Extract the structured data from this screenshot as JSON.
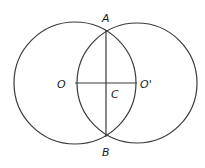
{
  "diagram": {
    "type": "geometry",
    "stroke_color": "#3a3a3a",
    "label_color": "#1a1a1a",
    "circles": [
      {
        "id": "circle-O",
        "cx": 75,
        "cy": 83,
        "r": 61
      },
      {
        "id": "circle-O-prime",
        "cx": 137,
        "cy": 83,
        "r": 60
      }
    ],
    "segments": [
      {
        "id": "segment-AB",
        "from": "A",
        "to": "B",
        "x1": 106,
        "y1": 30,
        "x2": 106,
        "y2": 137
      },
      {
        "id": "segment-OO-prime",
        "from": "O",
        "to": "O'",
        "x1": 75,
        "y1": 83,
        "x2": 137,
        "y2": 83
      }
    ],
    "points": {
      "A": {
        "x": 106,
        "y": 30
      },
      "B": {
        "x": 106,
        "y": 137
      },
      "O": {
        "x": 75,
        "y": 83
      },
      "O_prime": {
        "x": 137,
        "y": 83
      },
      "C": {
        "x": 106,
        "y": 83
      }
    },
    "labels": {
      "A": "A",
      "B": "B",
      "O": "O",
      "O_prime": "O'",
      "C": "C"
    }
  }
}
